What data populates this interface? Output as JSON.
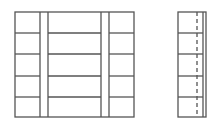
{
  "diagram": {
    "stroke": "#555555",
    "front_view": {
      "x": 15,
      "y": 12,
      "width": 119,
      "height": 105,
      "stiles": [
        40,
        48,
        101,
        109
      ],
      "rails": [
        33,
        54,
        76,
        97
      ]
    },
    "side_view": {
      "x": 178,
      "y": 12,
      "width": 28,
      "height": 105,
      "dashed_x": 197,
      "inner_x": 203,
      "rails": [
        33,
        54,
        76,
        97
      ]
    }
  }
}
